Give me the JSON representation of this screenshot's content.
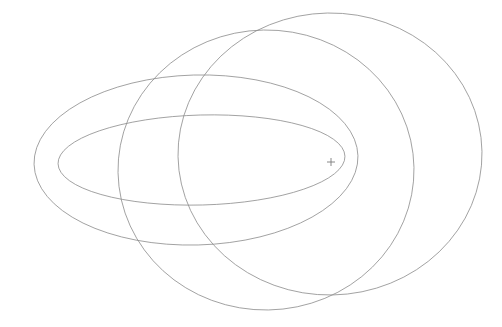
{
  "figure": {
    "background_color": "#ffffff",
    "width": 502,
    "height": 327
  },
  "style": {
    "stroke_color": "#8a8a8a",
    "stroke_color_light": "#9e9e9e",
    "stroke_width": 0.8,
    "marker_color": "#7a7a7a",
    "marker_stroke_width": 0.9
  },
  "focus": {
    "label": "focus-marker",
    "x": 331,
    "y": 162,
    "arm_length": 4,
    "glyph": "+"
  },
  "chart_data": {
    "type": "scatter",
    "subtitle": "",
    "xlabel": "",
    "ylabel": "",
    "xlim": [
      0,
      502
    ],
    "ylim": [
      0,
      327
    ],
    "grid": false,
    "legend": "none",
    "annotations": [
      {
        "name": "common-focus",
        "symbol": "+",
        "x": 331,
        "y": 162,
        "text": ""
      }
    ],
    "series": [
      {
        "name": "orbit-1-inner-flat-ellipse",
        "shape": "ellipse",
        "cx": 201.5,
        "cy": 160.0,
        "rx": 143.5,
        "ry": 45.0,
        "rotation_deg": -1.5,
        "left_vertex_x": 58,
        "right_vertex_x": 345,
        "top_y": 115,
        "bottom_y": 205,
        "eccentricity": 0.949
      },
      {
        "name": "orbit-2-outer-flat-ellipse",
        "shape": "ellipse",
        "cx": 196.0,
        "cy": 160.0,
        "rx": 162.0,
        "ry": 85.0,
        "rotation_deg": -1.5,
        "left_vertex_x": 34,
        "right_vertex_x": 358,
        "top_y": 75,
        "bottom_y": 245,
        "eccentricity": 0.851
      },
      {
        "name": "orbit-3-middle-round-ellipse",
        "shape": "ellipse",
        "cx": 266.0,
        "cy": 170.0,
        "rx": 148.0,
        "ry": 140.0,
        "rotation_deg": -1.0,
        "left_vertex_x": 118,
        "right_vertex_x": 414,
        "top_y": 30,
        "bottom_y": 310,
        "eccentricity": 0.322
      },
      {
        "name": "orbit-4-outer-round-ellipse",
        "shape": "ellipse",
        "cx": 330.0,
        "cy": 154.0,
        "rx": 152.0,
        "ry": 141.0,
        "rotation_deg": -1.0,
        "left_vertex_x": 178,
        "right_vertex_x": 482,
        "top_y": 13,
        "bottom_y": 295,
        "eccentricity": 0.373
      }
    ]
  }
}
